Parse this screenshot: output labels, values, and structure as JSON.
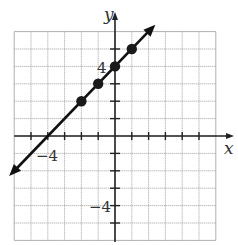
{
  "chart_data": {
    "type": "line",
    "title": "",
    "xlabel": "x",
    "ylabel": "y",
    "xlim": [
      -6,
      6
    ],
    "ylim": [
      -6,
      6
    ],
    "grid": true,
    "tick_labels": {
      "x": [
        "-4"
      ],
      "y": [
        "4",
        "-4"
      ]
    },
    "line": {
      "equation": "y = x + 4",
      "slope": 1,
      "intercept": 4,
      "arrows": "both",
      "from": [
        -6.3,
        -2.3
      ],
      "to": [
        2.4,
        6.4
      ]
    },
    "points": [
      {
        "x": -2,
        "y": 2
      },
      {
        "x": -1,
        "y": 3
      },
      {
        "x": 0,
        "y": 4
      },
      {
        "x": 1,
        "y": 5
      }
    ]
  },
  "labels": {
    "x_axis": "x",
    "y_axis": "y",
    "x_tick_neg4": "−4",
    "y_tick_pos4": "4",
    "y_tick_neg4": "−4"
  }
}
